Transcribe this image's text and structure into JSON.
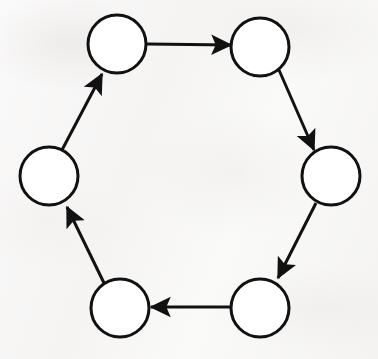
{
  "figure": {
    "kind": "directed-graph",
    "background_color": "#f8f7f6",
    "ink_color": "#111111",
    "node_fill": "#ffffff",
    "node_stroke_width": 3,
    "edge_stroke_width": 3,
    "node_radius": 29,
    "node_count": "6",
    "edge_count": "6",
    "direction": "clockwise",
    "canvas": {
      "width": "378",
      "height": "359"
    }
  },
  "nodes": [
    {
      "id": "n1",
      "label": "",
      "name": "node-top-left",
      "cx": 117,
      "cy": 44,
      "r": 29
    },
    {
      "id": "n2",
      "label": "",
      "name": "node-top-right",
      "cx": 260,
      "cy": 47,
      "r": 29
    },
    {
      "id": "n3",
      "label": "",
      "name": "node-right",
      "cx": 331,
      "cy": 176,
      "r": 29
    },
    {
      "id": "n4",
      "label": "",
      "name": "node-bottom-right",
      "cx": 260,
      "cy": 308,
      "r": 29
    },
    {
      "id": "n5",
      "label": "",
      "name": "node-bottom-left",
      "cx": 120,
      "cy": 308,
      "r": 29
    },
    {
      "id": "n6",
      "label": "",
      "name": "node-left",
      "cx": 49,
      "cy": 176,
      "r": 29
    }
  ],
  "edges": [
    {
      "id": "e1",
      "name": "edge-top-left-to-top-right",
      "from": "n1",
      "to": "n2",
      "label": "",
      "x1": 147,
      "y1": 44,
      "x2": 231,
      "y2": 45
    },
    {
      "id": "e2",
      "name": "edge-top-right-to-right",
      "from": "n2",
      "to": "n3",
      "label": "",
      "x1": 279,
      "y1": 70,
      "x2": 314,
      "y2": 150
    },
    {
      "id": "e3",
      "name": "edge-right-to-bottom-right",
      "from": "n3",
      "to": "n4",
      "label": "",
      "x1": 316,
      "y1": 203,
      "x2": 278,
      "y2": 278
    },
    {
      "id": "e4",
      "name": "edge-bottom-right-to-bottom-left",
      "from": "n4",
      "to": "n5",
      "label": "",
      "x1": 231,
      "y1": 307,
      "x2": 151,
      "y2": 307
    },
    {
      "id": "e5",
      "name": "edge-bottom-left-to-left",
      "from": "n5",
      "to": "n6",
      "label": "",
      "x1": 104,
      "y1": 283,
      "x2": 67,
      "y2": 207
    },
    {
      "id": "e6",
      "name": "edge-left-to-top-left",
      "from": "n6",
      "to": "n1",
      "label": "",
      "x1": 62,
      "y1": 150,
      "x2": 102,
      "y2": 74
    }
  ]
}
